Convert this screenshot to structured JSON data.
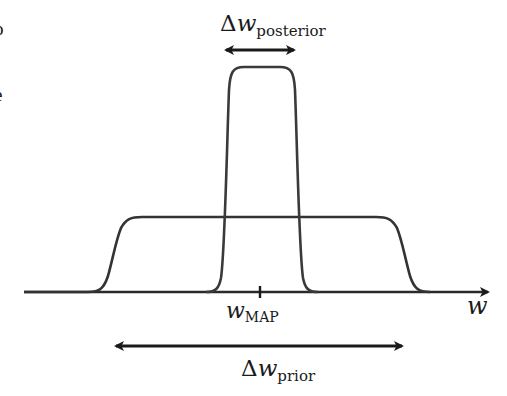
{
  "edge_clipped_text": [
    "o",
    "t",
    "-",
    "e"
  ],
  "diagram": {
    "axis": {
      "variable": "w",
      "tick_label_main": "w",
      "tick_label_sub": "MAP"
    },
    "posterior": {
      "label_prefix": "Δ",
      "label_var": "w",
      "label_sub": "posterior"
    },
    "prior": {
      "label_prefix": "Δ",
      "label_var": "w",
      "label_sub": "prior"
    },
    "colors": {
      "stroke": "#2a2a2a",
      "curve": "#3a3a3a",
      "background": "#ffffff"
    }
  }
}
